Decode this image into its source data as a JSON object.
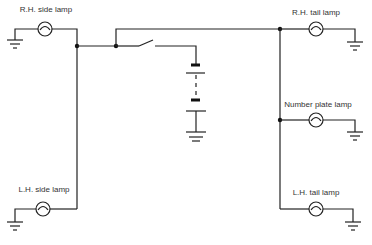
{
  "diagram": {
    "type": "lighting circuit schematic",
    "labels": {
      "rh_side_lamp": "R.H. side lamp",
      "lh_side_lamp": "L.H. side lamp",
      "rh_tail_lamp": "R.H. tail lamp",
      "number_plate_lamp": "Number plate lamp",
      "lh_tail_lamp": "L.H. tail lamp"
    },
    "components": [
      {
        "id": "rh_side_lamp",
        "kind": "lamp"
      },
      {
        "id": "lh_side_lamp",
        "kind": "lamp"
      },
      {
        "id": "switch",
        "kind": "switch",
        "state": "open"
      },
      {
        "id": "battery",
        "kind": "battery"
      },
      {
        "id": "rh_tail_lamp",
        "kind": "lamp"
      },
      {
        "id": "number_plate_lamp",
        "kind": "lamp"
      },
      {
        "id": "lh_tail_lamp",
        "kind": "lamp"
      }
    ],
    "colors": {
      "line": "#222222",
      "background": "#ffffff"
    }
  }
}
